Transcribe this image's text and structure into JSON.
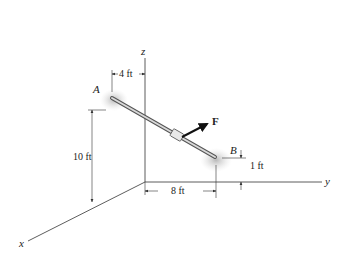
{
  "diagram": {
    "axes": {
      "x": "x",
      "y": "y",
      "z": "z"
    },
    "points": {
      "A": "A",
      "B": "B"
    },
    "force": "F",
    "dimensions": {
      "offset_A": "4 ft",
      "height_A": "10 ft",
      "distance_B": "8 ft",
      "height_B": "1 ft"
    }
  }
}
